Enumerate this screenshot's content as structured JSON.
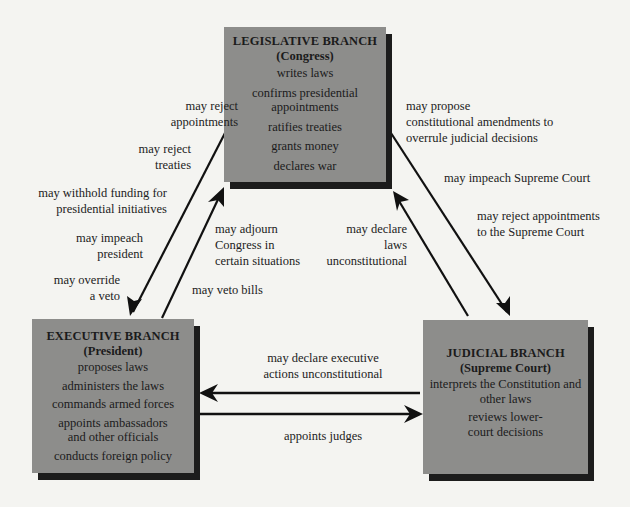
{
  "diagram": {
    "colors": {
      "background": "#f4f4f1",
      "box_fill": "#8d8d8b",
      "box_shadow": "#1c1c1c",
      "arrow": "#111111"
    },
    "branches": {
      "legislative": {
        "title": "LEGISLATIVE BRANCH",
        "subtitle": "(Congress)",
        "powers": [
          "writes laws",
          "confirms presidential appointments",
          "ratifies treaties",
          "grants money",
          "declares war"
        ]
      },
      "executive": {
        "title": "EXECUTIVE BRANCH",
        "subtitle": "(President)",
        "powers": [
          "proposes laws",
          "administers the laws",
          "commands armed forces",
          "appoints ambassadors and other officials",
          "conducts foreign policy"
        ]
      },
      "judicial": {
        "title": "JUDICIAL BRANCH",
        "subtitle": "(Supreme Court)",
        "powers": [
          "interprets the Constitution and other laws",
          "reviews lower-court decisions"
        ]
      }
    },
    "checks": {
      "legislative_on_executive": [
        "may reject\nappointments",
        "may reject\ntreaties",
        "may withhold funding for\npresidential initiatives",
        "may impeach\npresident",
        "may override\na veto"
      ],
      "executive_on_legislative": [
        "may adjourn\nCongress in\ncertain situations",
        "may veto bills"
      ],
      "legislative_on_judicial": [
        "may propose\nconstitutional amendments to\noverrule judicial decisions",
        "may impeach Supreme Court",
        "may reject appointments\nto the Supreme Court"
      ],
      "judicial_on_legislative": [
        "may declare\nlaws\nunconstitutional"
      ],
      "judicial_on_executive": [
        "may declare executive\nactions unconstitutional"
      ],
      "executive_on_judicial": [
        "appoints judges"
      ]
    }
  }
}
